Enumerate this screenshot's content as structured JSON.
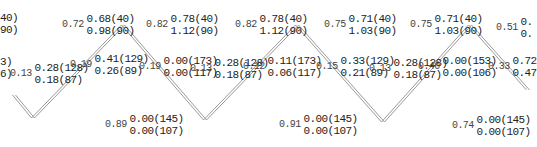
{
  "diagram": {
    "zigzag": {
      "points": [
        [
          14,
          95
        ],
        [
          33,
          118
        ],
        [
          123,
          25
        ],
        [
          205,
          120
        ],
        [
          297,
          25
        ],
        [
          383,
          122
        ],
        [
          470,
          25
        ],
        [
          528,
          90
        ]
      ],
      "stroke": "#9a9a9a",
      "gap": 3
    },
    "labels": [
      {
        "id": "edge-left-top",
        "x": 0,
        "y": 12,
        "ratio": "",
        "line1": "40)",
        "line2": "90)"
      },
      {
        "id": "edge-left-mid",
        "x": 0,
        "y": 56,
        "ratio": "",
        "line1": "3)",
        "line2": "6)"
      },
      {
        "id": "left-inner",
        "x": 10,
        "y": 62,
        "ratio": "0.13",
        "line1": "0.28(128)",
        "line2": "0.18(87)"
      },
      {
        "id": "top-1",
        "x": 62,
        "y": 13,
        "ratio": "0.72",
        "line1": "0.68(40)",
        "line2": "0.98(90)"
      },
      {
        "id": "mid-1a",
        "x": 70,
        "y": 53,
        "ratio": "0.19",
        "line1": "0.41(129)",
        "line2": "0.26(89)"
      },
      {
        "id": "mid-1b",
        "x": 139,
        "y": 55,
        "ratio": "0.19",
        "line1": "0.00(173)",
        "line2": "0.00(117)"
      },
      {
        "id": "top-2",
        "x": 146,
        "y": 13,
        "ratio": "0.82",
        "line1": "0.78(40)",
        "line2": "1.12(90)"
      },
      {
        "id": "bottom-1",
        "x": 105,
        "y": 113,
        "ratio": "0.89",
        "line1": "0.00(145)",
        "line2": "0.00(107)"
      },
      {
        "id": "mid-2a",
        "x": 190,
        "y": 57,
        "ratio": "0.13",
        "line1": "0.28(128)",
        "line2": "0.18(87)"
      },
      {
        "id": "mid-2b",
        "x": 243,
        "y": 55,
        "ratio": "0.12",
        "line1": "0.11(173)",
        "line2": "0.06(117)"
      },
      {
        "id": "top-3",
        "x": 235,
        "y": 13,
        "ratio": "0.82",
        "line1": "0.78(40)",
        "line2": "1.12(90)"
      },
      {
        "id": "bottom-2",
        "x": 279,
        "y": 113,
        "ratio": "0.91",
        "line1": "0.00(145)",
        "line2": "0.00(107)"
      },
      {
        "id": "top-4",
        "x": 324,
        "y": 13,
        "ratio": "0.75",
        "line1": "0.71(40)",
        "line2": "1.03(90)"
      },
      {
        "id": "mid-3a",
        "x": 316,
        "y": 55,
        "ratio": "0.15",
        "line1": "0.33(129)",
        "line2": "0.21(89)"
      },
      {
        "id": "mid-3b",
        "x": 369,
        "y": 57,
        "ratio": "0.13",
        "line1": "0.28(128)",
        "line2": "0.18(87)"
      },
      {
        "id": "top-5",
        "x": 410,
        "y": 13,
        "ratio": "0.75",
        "line1": "0.71(40)",
        "line2": "1.03(90)"
      },
      {
        "id": "mid-4a",
        "x": 418,
        "y": 55,
        "ratio": "0.40",
        "line1": "0.00(153)",
        "line2": "0.00(106)"
      },
      {
        "id": "bottom-3",
        "x": 452,
        "y": 114,
        "ratio": "0.74",
        "line1": "0.00(145)",
        "line2": "0.00(107)"
      },
      {
        "id": "top-6",
        "x": 496,
        "y": 16,
        "ratio": "0.51",
        "line1": "0.",
        "line2": "0."
      },
      {
        "id": "mid-4b",
        "x": 488,
        "y": 55,
        "ratio": "0.33",
        "line1": "0.72",
        "line2": "0.47"
      }
    ]
  }
}
